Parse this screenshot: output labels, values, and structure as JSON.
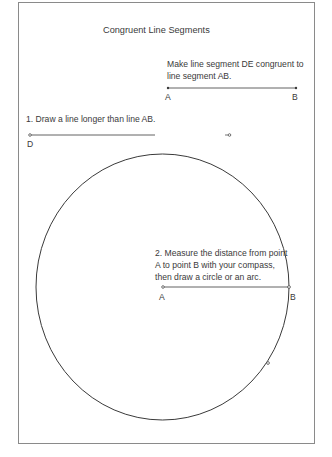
{
  "worksheet": {
    "title": "Congruent Line Segments",
    "instruction": "Make line segment DE congruent to line segment AB.",
    "reference_segment": {
      "start_label": "A",
      "end_label": "B"
    },
    "step1": {
      "text": "1. Draw a line longer than line AB.",
      "start_label": "D"
    },
    "step2": {
      "text": "2. Measure the distance from point A to point B with your compass, then draw a circle or an arc.",
      "center_label": "A",
      "radius_end_label": "B"
    }
  },
  "colors": {
    "ink": "#3a3a3a",
    "frame": "#8a8a8a",
    "background": "#ffffff"
  }
}
